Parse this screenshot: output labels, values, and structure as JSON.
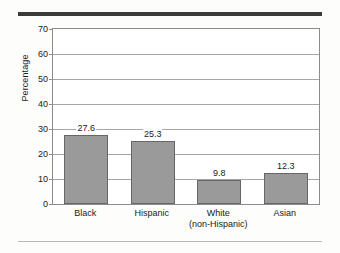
{
  "chart_data": {
    "type": "bar",
    "title": "",
    "xlabel": "",
    "ylabel": "Percentage",
    "categories": [
      "Black",
      "Hispanic",
      "White\n(non-Hispanic)",
      "Asian"
    ],
    "category_lines": [
      [
        "Black"
      ],
      [
        "Hispanic"
      ],
      [
        "White",
        "(non-Hispanic)"
      ],
      [
        "Asian"
      ]
    ],
    "values": [
      27.6,
      25.3,
      9.8,
      12.3
    ],
    "value_labels": [
      "27.6",
      "25.3",
      "9.8",
      "12.3"
    ],
    "ylim": [
      0,
      70
    ],
    "yticks": [
      0,
      10,
      20,
      30,
      40,
      50,
      60,
      70
    ],
    "ytick_labels": [
      "0",
      "10",
      "20",
      "30",
      "40",
      "50",
      "60",
      "70"
    ],
    "grid": true,
    "legend": false,
    "legend_position": "none",
    "bar_color": "#9a9a9a",
    "bar_border_color": "#666666",
    "gridline_color": "#a5a5a5",
    "axis_color": "#8c8c8c",
    "background_color": "#fdfdfb",
    "plot_background_color": "#ffffff",
    "rule_color_top": "#3b3b3b",
    "rule_color_bottom": "#b9b9b9"
  }
}
